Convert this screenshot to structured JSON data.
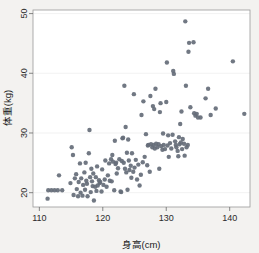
{
  "chart_data": {
    "type": "scatter",
    "title": "",
    "subtitle": "",
    "xlabel": "身高(cm)",
    "ylabel": "体重(kg)",
    "xlim": [
      109.0,
      143.2
    ],
    "ylim": [
      17.6,
      50.6
    ],
    "xticks": [
      110,
      120,
      130,
      140
    ],
    "yticks": [
      20,
      30,
      40,
      50
    ],
    "xtick_labels": [
      "110",
      "120",
      "130",
      "140"
    ],
    "ytick_labels": [
      "20",
      "30",
      "40",
      "50"
    ],
    "grid": "horizontal-faint",
    "legend": null,
    "legend_position": "none",
    "marker": "filled-circle",
    "marker_color": "#656d78",
    "marker_size_px": 4.4,
    "panel_background": "#ffffff",
    "figure_background": "#f3f2f0",
    "n_points": 171,
    "relationship": "positive correlation between height and weight",
    "points": [
      [
        111.3,
        19.0
      ],
      [
        111.4,
        20.4
      ],
      [
        111.9,
        20.4
      ],
      [
        112.4,
        20.4
      ],
      [
        112.9,
        20.4
      ],
      [
        113.1,
        22.9
      ],
      [
        113.6,
        20.4
      ],
      [
        114.9,
        21.6
      ],
      [
        115.1,
        27.6
      ],
      [
        115.3,
        26.3
      ],
      [
        115.4,
        19.6
      ],
      [
        115.6,
        22.4
      ],
      [
        115.8,
        23.1
      ],
      [
        115.9,
        20.6
      ],
      [
        116.1,
        19.4
      ],
      [
        116.2,
        21.8
      ],
      [
        116.4,
        24.9
      ],
      [
        116.5,
        20.0
      ],
      [
        116.6,
        22.4
      ],
      [
        116.8,
        19.5
      ],
      [
        116.9,
        21.3
      ],
      [
        117.1,
        23.4
      ],
      [
        117.2,
        20.5
      ],
      [
        117.3,
        25.0
      ],
      [
        117.4,
        22.0
      ],
      [
        117.5,
        21.5
      ],
      [
        117.6,
        19.4
      ],
      [
        117.8,
        26.6
      ],
      [
        117.9,
        30.5
      ],
      [
        118.0,
        22.6
      ],
      [
        118.1,
        20.1
      ],
      [
        118.2,
        24.0
      ],
      [
        118.3,
        21.9
      ],
      [
        118.4,
        21.1
      ],
      [
        118.5,
        23.2
      ],
      [
        118.6,
        18.7
      ],
      [
        118.8,
        21.0
      ],
      [
        118.9,
        22.6
      ],
      [
        119.0,
        20.3
      ],
      [
        119.1,
        24.4
      ],
      [
        119.2,
        21.2
      ],
      [
        119.4,
        22.1
      ],
      [
        119.5,
        21.6
      ],
      [
        119.6,
        21.8
      ],
      [
        119.8,
        20.2
      ],
      [
        119.9,
        23.9
      ],
      [
        120.1,
        21.3
      ],
      [
        120.3,
        22.2
      ],
      [
        120.4,
        25.4
      ],
      [
        120.6,
        21.0
      ],
      [
        120.8,
        22.9
      ],
      [
        121.0,
        24.9
      ],
      [
        121.1,
        22.0
      ],
      [
        121.3,
        25.6
      ],
      [
        121.4,
        21.9
      ],
      [
        121.5,
        26.3
      ],
      [
        121.6,
        25.2
      ],
      [
        121.8,
        20.4
      ],
      [
        121.9,
        28.7
      ],
      [
        122.0,
        24.8
      ],
      [
        122.1,
        25.0
      ],
      [
        122.2,
        23.2
      ],
      [
        122.4,
        24.1
      ],
      [
        122.6,
        25.6
      ],
      [
        122.8,
        20.2
      ],
      [
        122.9,
        20.1
      ],
      [
        123.0,
        25.3
      ],
      [
        123.1,
        29.1
      ],
      [
        123.2,
        29.2
      ],
      [
        123.3,
        25.0
      ],
      [
        123.4,
        37.9
      ],
      [
        123.5,
        24.0
      ],
      [
        123.6,
        31.0
      ],
      [
        123.7,
        23.4
      ],
      [
        123.8,
        26.7
      ],
      [
        123.9,
        20.5
      ],
      [
        124.0,
        28.9
      ],
      [
        124.1,
        25.4
      ],
      [
        124.2,
        23.8
      ],
      [
        124.4,
        24.5
      ],
      [
        124.5,
        22.5
      ],
      [
        124.6,
        26.6
      ],
      [
        124.8,
        23.5
      ],
      [
        124.9,
        36.5
      ],
      [
        125.0,
        24.2
      ],
      [
        125.2,
        25.5
      ],
      [
        125.4,
        22.2
      ],
      [
        125.6,
        24.7
      ],
      [
        125.8,
        21.2
      ],
      [
        126.0,
        23.0
      ],
      [
        126.1,
        33.0
      ],
      [
        126.3,
        25.1
      ],
      [
        126.4,
        35.3
      ],
      [
        126.6,
        26.0
      ],
      [
        126.8,
        29.8
      ],
      [
        127.0,
        24.6
      ],
      [
        127.1,
        27.9
      ],
      [
        127.2,
        28.0
      ],
      [
        127.4,
        23.5
      ],
      [
        127.5,
        36.2
      ],
      [
        127.6,
        28.1
      ],
      [
        127.8,
        27.6
      ],
      [
        127.9,
        34.5
      ],
      [
        128.0,
        28.0
      ],
      [
        128.1,
        34.0
      ],
      [
        128.2,
        27.4
      ],
      [
        128.3,
        37.4
      ],
      [
        128.4,
        28.2
      ],
      [
        128.6,
        27.6
      ],
      [
        128.8,
        28.1
      ],
      [
        128.9,
        24.0
      ],
      [
        129.0,
        33.5
      ],
      [
        129.1,
        35.0
      ],
      [
        129.2,
        27.8
      ],
      [
        129.4,
        27.2
      ],
      [
        129.5,
        29.9
      ],
      [
        129.6,
        28.0
      ],
      [
        129.8,
        27.3
      ],
      [
        130.0,
        35.2
      ],
      [
        130.1,
        41.8
      ],
      [
        130.2,
        27.9
      ],
      [
        130.3,
        29.6
      ],
      [
        130.4,
        26.0
      ],
      [
        130.6,
        28.3
      ],
      [
        130.8,
        27.4
      ],
      [
        131.0,
        29.7
      ],
      [
        131.1,
        40.4
      ],
      [
        131.2,
        39.9
      ],
      [
        131.4,
        28.6
      ],
      [
        131.5,
        28.0
      ],
      [
        131.6,
        27.6
      ],
      [
        131.8,
        27.0
      ],
      [
        131.9,
        26.1
      ],
      [
        132.0,
        29.3
      ],
      [
        132.1,
        28.1
      ],
      [
        132.2,
        31.5
      ],
      [
        132.3,
        28.4
      ],
      [
        132.4,
        33.6
      ],
      [
        132.5,
        27.3
      ],
      [
        132.6,
        29.0
      ],
      [
        132.8,
        28.2
      ],
      [
        132.9,
        26.2
      ],
      [
        133.0,
        48.7
      ],
      [
        133.1,
        37.9
      ],
      [
        133.2,
        27.6
      ],
      [
        133.4,
        28.0
      ],
      [
        133.5,
        43.6
      ],
      [
        133.6,
        45.1
      ],
      [
        133.8,
        34.3
      ],
      [
        134.3,
        45.2
      ],
      [
        134.4,
        33.3
      ],
      [
        134.6,
        32.9
      ],
      [
        134.8,
        33.2
      ],
      [
        135.0,
        32.6
      ],
      [
        135.4,
        32.6
      ],
      [
        136.2,
        35.8
      ],
      [
        136.6,
        37.4
      ],
      [
        137.0,
        33.0
      ],
      [
        137.8,
        34.1
      ],
      [
        140.5,
        42.0
      ],
      [
        142.3,
        33.2
      ]
    ]
  },
  "axes": {
    "x_axis_name": "x-axis",
    "y_axis_name": "y-axis"
  }
}
